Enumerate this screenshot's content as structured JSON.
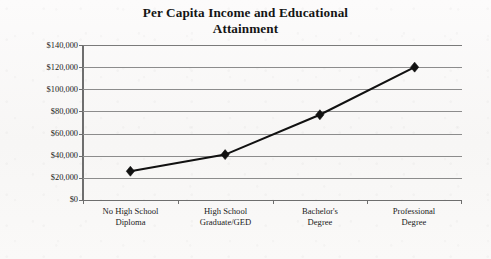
{
  "chart_data": {
    "type": "line",
    "title": "Per Capita Income and Educational Attainment",
    "title_lines": [
      "Per Capita Income and Educational",
      "Attainment"
    ],
    "categories": [
      "No High School Diploma",
      "High School Graduate/GED",
      "Bachelor's Degree",
      "Professional Degree"
    ],
    "category_lines": [
      [
        "No High School",
        "Diploma"
      ],
      [
        "High School",
        "Graduate/GED"
      ],
      [
        "Bachelor's",
        "Degree"
      ],
      [
        "Professional",
        "Degree"
      ]
    ],
    "values": [
      26000,
      41000,
      77000,
      120000
    ],
    "xlabel": "",
    "ylabel": "",
    "ylim": [
      0,
      140000
    ],
    "y_tick_step": 20000,
    "y_tick_labels": [
      "$140,000",
      "$120,000",
      "$100,000",
      "$80,000",
      "$60,000",
      "$40,000",
      "$20,000",
      "$0"
    ],
    "y_tick_values": [
      140000,
      120000,
      100000,
      80000,
      60000,
      40000,
      20000,
      0
    ],
    "grid": true,
    "legend": false,
    "legend_position": "none",
    "marker": "diamond",
    "series_color": "#111111",
    "gridline_color": "#8c8c8c",
    "background_color": "#fbfafa"
  }
}
